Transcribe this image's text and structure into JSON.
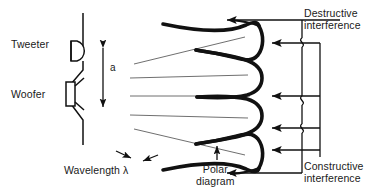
{
  "figure": {
    "kind": "loudspeaker-interference-diagram",
    "background_color": "#ffffff",
    "line_color": "#111111",
    "thin_ray_color": "#4a4a4a"
  },
  "labels": {
    "tweeter": "Tweeter",
    "woofer": "Woofer",
    "spacing_dimension": "a",
    "wavelength": "Wavelength λ",
    "destructive_line1": "Destructive",
    "destructive_line2": "interference",
    "polar_line1": "Polar",
    "polar_line2": "diagram",
    "constructive_line1": "Constructive",
    "constructive_line2": "interference"
  },
  "icons": {
    "tweeter": "tweeter-dome-icon",
    "woofer": "woofer-cone-icon",
    "dimension_arrow": "double-headed-arrow-icon",
    "wavelength_arrows": "wavelength-inward-arrows-icon",
    "pointer_arrow": "left-arrow-icon",
    "polar_pointer": "up-arrow-icon"
  },
  "callouts": {
    "destructive_arrow_count": 3,
    "constructive_arrow_count": 3,
    "total_lobe_arrows": 6
  }
}
